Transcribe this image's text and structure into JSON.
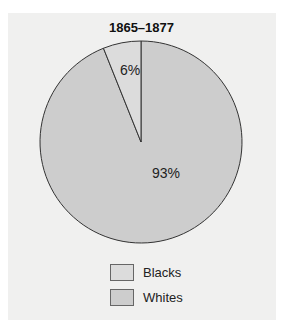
{
  "chart_data": {
    "type": "pie",
    "title": "1865–1877",
    "categories": [
      "Blacks",
      "Whites"
    ],
    "values": [
      6,
      93
    ],
    "labels": [
      "6%",
      "93%"
    ],
    "colors": [
      "#dcdcdc",
      "#cdcdcd"
    ],
    "start_angle_deg": 0,
    "direction": "counterclockwise-from-top for Blacks",
    "legend_position": "bottom"
  },
  "legend": {
    "items": [
      {
        "label": "Blacks",
        "color": "#dcdcdc"
      },
      {
        "label": "Whites",
        "color": "#cdcdcd"
      }
    ]
  }
}
